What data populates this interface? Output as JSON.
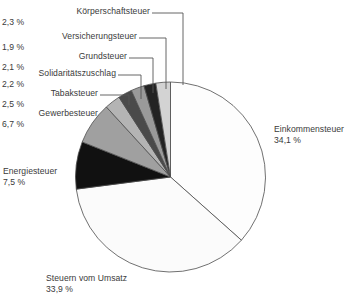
{
  "chart_data": {
    "type": "pie",
    "title": "",
    "unit": "%",
    "legend_position": "callout-labels",
    "grid": false,
    "categories": [
      "Einkommensteuer",
      "Steuern vom Umsatz",
      "Energiesteuer",
      "Gewerbesteuer",
      "Tabaksteuer",
      "Solidaritätszuschlag",
      "Grundsteuer",
      "Versicherungsteuer",
      "Körperschaftsteuer"
    ],
    "values": [
      34.1,
      33.9,
      7.5,
      6.7,
      2.5,
      2.2,
      2.1,
      1.9,
      2.3
    ],
    "value_labels": [
      "34,1 %",
      "33,9 %",
      "7,5 %",
      "6,7 %",
      "2,5 %",
      "2,2 %",
      "2,1 %",
      "1,9 %",
      "2,3 %"
    ],
    "colors": [
      "#fdfdfd",
      "#fbfbfb",
      "#111111",
      "#a0a0a0",
      "#b4b4b4",
      "#4a4a4a",
      "#9a9a9a",
      "#232323",
      "#d3d3d3"
    ],
    "slices": [
      {
        "label": "Einkommensteuer",
        "value": 34.1,
        "value_label": "34,1 %",
        "color": "#fdfdfd"
      },
      {
        "label": "Steuern vom Umsatz",
        "value": 33.9,
        "value_label": "33,9 %",
        "color": "#fbfbfb"
      },
      {
        "label": "Energiesteuer",
        "value": 7.5,
        "value_label": "7,5 %",
        "color": "#111111"
      },
      {
        "label": "Gewerbesteuer",
        "value": 6.7,
        "value_label": "6,7 %",
        "color": "#a0a0a0"
      },
      {
        "label": "Tabaksteuer",
        "value": 2.5,
        "value_label": "2,5 %",
        "color": "#b4b4b4"
      },
      {
        "label": "Solidaritätszuschlag",
        "value": 2.2,
        "value_label": "2,2 %",
        "color": "#4a4a4a"
      },
      {
        "label": "Grundsteuer",
        "value": 2.1,
        "value_label": "2,1 %",
        "color": "#9a9a9a"
      },
      {
        "label": "Versicherungsteuer",
        "value": 1.9,
        "value_label": "1,9 %",
        "color": "#232323"
      },
      {
        "label": "Körperschaftsteuer",
        "value": 2.3,
        "value_label": "2,3 %",
        "color": "#d3d3d3"
      }
    ]
  },
  "labels": {
    "koerperschaftsteuer": {
      "name": "Körperschaftsteuer",
      "pct": "2,3 %"
    },
    "versicherungsteuer": {
      "name": "Versicherungsteuer",
      "pct": "1,9 %"
    },
    "grundsteuer": {
      "name": "Grundsteuer",
      "pct": "2,1 %"
    },
    "solidaritaetszuschlag": {
      "name": "Solidaritätszuschlag",
      "pct": "2,2 %"
    },
    "tabaksteuer": {
      "name": "Tabaksteuer",
      "pct": "2,5 %"
    },
    "gewerbesteuer": {
      "name": "Gewerbesteuer",
      "pct": "6,7 %"
    },
    "energiesteuer": {
      "name": "Energiesteuer",
      "pct": "7,5 %"
    },
    "steuern_vom_umsatz": {
      "name": "Steuern vom Umsatz",
      "pct": "33,9 %"
    },
    "einkommensteuer": {
      "name": "Einkommensteuer",
      "pct": "34,1 %"
    }
  }
}
